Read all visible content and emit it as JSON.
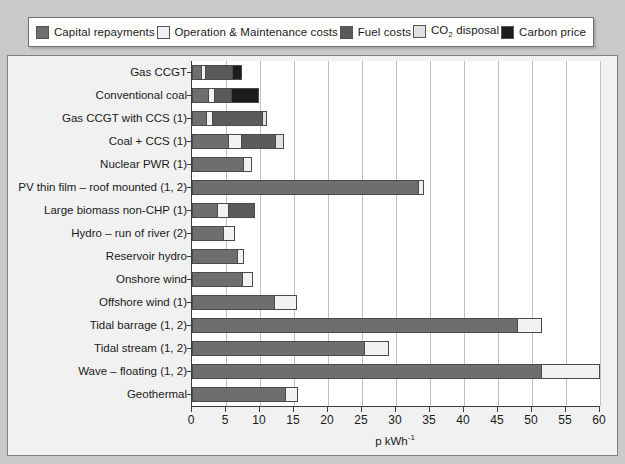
{
  "legend": {
    "items": [
      {
        "label": "Capital repayments",
        "key": "capital",
        "color": "#6e6e6e"
      },
      {
        "label": "Operation & Maintenance costs",
        "key": "om",
        "color": "#f2f2f2"
      },
      {
        "label": "Fuel costs",
        "key": "fuel",
        "color": "#5a5a5a"
      },
      {
        "label": "CO2 disposal",
        "key": "co2",
        "color": "#e2e2e2"
      },
      {
        "label": "Carbon price",
        "key": "carbon",
        "color": "#1d1d1d"
      }
    ]
  },
  "axis": {
    "xlabel": "p kWh",
    "xlabel_sup": "-1",
    "xticks": [
      0,
      5,
      10,
      15,
      20,
      25,
      30,
      35,
      40,
      45,
      50,
      55,
      60
    ],
    "xmin": 0,
    "xmax": 60
  },
  "chart_data": {
    "type": "bar",
    "orientation": "horizontal",
    "stacked": true,
    "title": "",
    "xlabel": "p kWh-1",
    "ylabel": "",
    "xlim": [
      0,
      60
    ],
    "grid": true,
    "legend_position": "top",
    "categories": [
      "Gas CCGT",
      "Conventional coal",
      "Gas CCGT with CCS (1)",
      "Coal + CCS (1)",
      "Nuclear PWR (1)",
      "PV thin film – roof mounted (1, 2)",
      "Large biomass non-CHP (1)",
      "Hydro – run of river (2)",
      "Reservoir hydro",
      "Onshore wind",
      "Offshore wind (1)",
      "Tidal barrage (1, 2)",
      "Tidal stream (1, 2)",
      "Wave – floating (1, 2)",
      "Geothermal"
    ],
    "series": [
      {
        "name": "Capital repayments",
        "color": "#6e6e6e",
        "values": [
          1.3,
          2.4,
          2.0,
          5.5,
          7.7,
          33.5,
          3.7,
          4.8,
          6.9,
          7.6,
          12.2,
          48.0,
          25.5,
          51.5,
          13.9
        ]
      },
      {
        "name": "Operation & Maintenance costs",
        "color": "#f2f2f2",
        "values": [
          0.5,
          0.8,
          0.8,
          1.8,
          1.1,
          0.6,
          1.6,
          1.5,
          0.7,
          1.4,
          3.3,
          3.5,
          3.5,
          8.5,
          1.7
        ]
      },
      {
        "name": "Fuel costs",
        "color": "#5a5a5a",
        "values": [
          4.2,
          2.5,
          7.7,
          5.2,
          0.0,
          0.0,
          3.9,
          0.0,
          0.0,
          0.0,
          0.0,
          0.0,
          0.0,
          0.0,
          0.0
        ]
      },
      {
        "name": "CO2 disposal",
        "color": "#e2e2e2",
        "values": [
          0.0,
          0.0,
          0.5,
          1.0,
          0.0,
          0.0,
          0.0,
          0.0,
          0.0,
          0.0,
          0.0,
          0.0,
          0.0,
          0.0,
          0.0
        ]
      },
      {
        "name": "Carbon price",
        "color": "#1d1d1d",
        "values": [
          1.3,
          4.1,
          0.0,
          0.0,
          0.0,
          0.0,
          0.0,
          0.0,
          0.0,
          0.0,
          0.0,
          0.0,
          0.0,
          0.0,
          0.0
        ]
      }
    ],
    "totals": [
      7.3,
      9.8,
      11.0,
      13.5,
      8.8,
      34.1,
      9.2,
      6.3,
      7.6,
      9.0,
      15.5,
      51.5,
      29.0,
      60.0,
      15.6
    ]
  }
}
